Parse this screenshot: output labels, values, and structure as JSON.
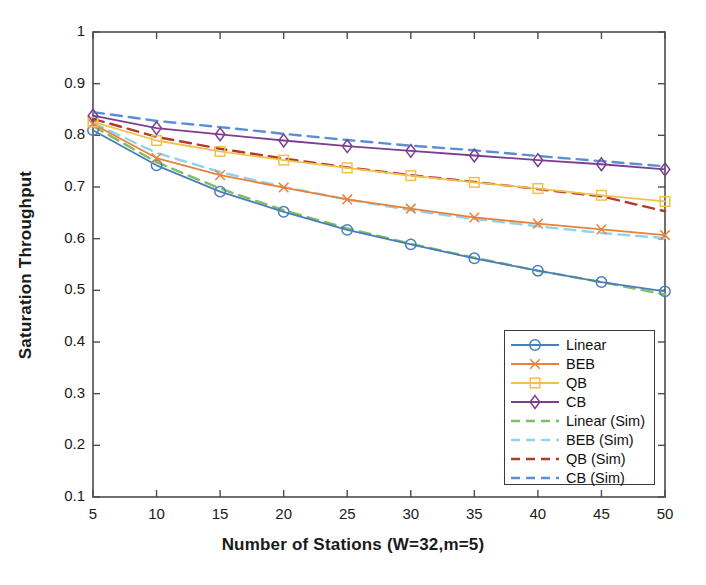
{
  "chart_data": {
    "type": "line",
    "title": "",
    "xlabel": "Number of Stations (W=32,m=5)",
    "ylabel": "Saturation Throughput",
    "x": [
      5,
      10,
      15,
      20,
      25,
      30,
      35,
      40,
      45,
      50
    ],
    "xlim": [
      5,
      50
    ],
    "ylim": [
      0.1,
      1
    ],
    "xticks": [
      "5",
      "10",
      "15",
      "20",
      "25",
      "30",
      "35",
      "40",
      "45",
      "50"
    ],
    "yticks": [
      "0.1",
      "0.2",
      "0.3",
      "0.4",
      "0.5",
      "0.6",
      "0.7",
      "0.8",
      "0.9",
      "1"
    ],
    "grid": false,
    "legend_position": "lower right",
    "series": [
      {
        "name": "Linear",
        "style": "solid",
        "marker": "circle",
        "color": "#4a7ebb",
        "values": [
          0.81,
          0.742,
          0.691,
          0.652,
          0.617,
          0.589,
          0.562,
          0.538,
          0.516,
          0.498
        ]
      },
      {
        "name": "BEB",
        "style": "solid",
        "marker": "x",
        "color": "#e8813a",
        "values": [
          0.822,
          0.756,
          0.723,
          0.699,
          0.676,
          0.658,
          0.641,
          0.629,
          0.618,
          0.607
        ]
      },
      {
        "name": "QB",
        "style": "solid",
        "marker": "square",
        "color": "#f2c14a",
        "values": [
          0.826,
          0.79,
          0.769,
          0.752,
          0.737,
          0.722,
          0.709,
          0.697,
          0.684,
          0.672
        ]
      },
      {
        "name": "CB",
        "style": "solid",
        "marker": "diamond",
        "color": "#7b3f8f",
        "values": [
          0.838,
          0.814,
          0.802,
          0.79,
          0.779,
          0.77,
          0.761,
          0.752,
          0.744,
          0.734
        ]
      },
      {
        "name": "Linear (Sim)",
        "style": "dashed",
        "marker": "none",
        "color": "#7fbf5f",
        "values": [
          0.818,
          0.748,
          0.697,
          0.655,
          0.62,
          0.59,
          0.563,
          0.538,
          0.516,
          0.492
        ]
      },
      {
        "name": "BEB (Sim)",
        "style": "dashed",
        "marker": "none",
        "color": "#8fd4ec",
        "values": [
          0.824,
          0.766,
          0.729,
          0.7,
          0.676,
          0.655,
          0.638,
          0.624,
          0.611,
          0.601
        ]
      },
      {
        "name": "QB (Sim)",
        "style": "dashed",
        "marker": "none",
        "color": "#b03a2e",
        "values": [
          0.832,
          0.797,
          0.774,
          0.755,
          0.738,
          0.723,
          0.71,
          0.696,
          0.682,
          0.653
        ]
      },
      {
        "name": "CB (Sim)",
        "style": "dashed",
        "marker": "none",
        "color": "#5b8ed6",
        "values": [
          0.845,
          0.828,
          0.816,
          0.803,
          0.791,
          0.78,
          0.771,
          0.76,
          0.75,
          0.74
        ]
      }
    ]
  },
  "axes": {
    "box_color": "#4d4d4d"
  }
}
